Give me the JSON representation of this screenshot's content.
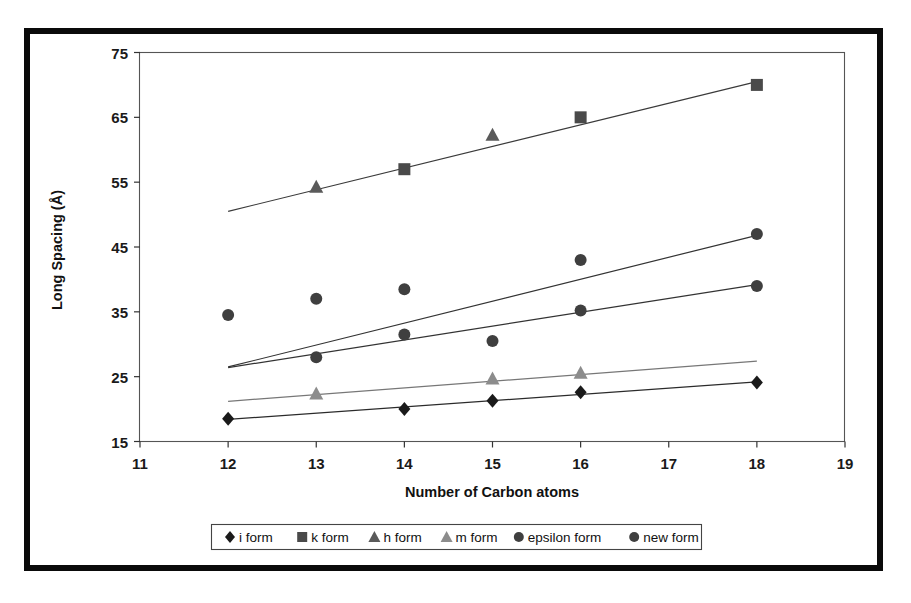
{
  "figure": {
    "frame_color": "#0a0a0a",
    "background": "#ffffff"
  },
  "chart_data": {
    "type": "scatter",
    "title": "",
    "xlabel": "Number of Carbon atoms",
    "ylabel": "Long Spacing (Å)",
    "xlim": [
      11,
      19
    ],
    "ylim": [
      15,
      75
    ],
    "xticks": [
      11,
      12,
      13,
      14,
      15,
      16,
      17,
      18,
      19
    ],
    "yticks": [
      15,
      25,
      35,
      45,
      55,
      65,
      75
    ],
    "xtick_labels": [
      "11",
      "12",
      "13",
      "14",
      "15",
      "16",
      "17",
      "18",
      "19"
    ],
    "ytick_labels": [
      "15",
      "25",
      "35",
      "45",
      "55",
      "65",
      "75"
    ],
    "grid": false,
    "legend_position": "bottom",
    "series": [
      {
        "name": "i form",
        "marker": "diamond",
        "color": "#1a1a1a",
        "line_color": "#2b2b2b",
        "x": [
          12,
          14,
          15,
          16,
          18
        ],
        "y": [
          18.5,
          20.0,
          21.3,
          22.6,
          24.1
        ],
        "trend": {
          "x": [
            12,
            18
          ],
          "y": [
            18.4,
            24.2
          ]
        }
      },
      {
        "name": "k form",
        "marker": "square",
        "color": "#4a4a4a",
        "line_color": "#3a3a3a",
        "x": [
          14,
          16,
          18
        ],
        "y": [
          57.0,
          65.0,
          70.0
        ],
        "trend": {
          "x": [
            12,
            18
          ],
          "y": [
            50.5,
            70.5
          ]
        }
      },
      {
        "name": "h form",
        "marker": "triangle",
        "color": "#5a5a5a",
        "line_color": "#3a3a3a",
        "x": [
          13,
          15
        ],
        "y": [
          54.3,
          62.3
        ],
        "trend": {
          "x": [
            12,
            18
          ],
          "y": [
            50.5,
            70.5
          ]
        }
      },
      {
        "name": "m form",
        "marker": "triangle",
        "color": "#8c8c8c",
        "line_color": "#777777",
        "x": [
          13,
          15,
          16
        ],
        "y": [
          22.4,
          24.7,
          25.6
        ],
        "trend": {
          "x": [
            12,
            18
          ],
          "y": [
            21.2,
            27.4
          ]
        }
      },
      {
        "name": "epsilon form",
        "marker": "circle",
        "color": "#3f3f3f",
        "line_color": "#333333",
        "x": [
          12,
          13,
          14,
          16,
          18
        ],
        "y": [
          34.5,
          37.0,
          38.5,
          43.0,
          47.0
        ],
        "trend": {
          "x": [
            12,
            18
          ],
          "y": [
            26.5,
            46.8
          ]
        }
      },
      {
        "name": "new form",
        "marker": "circle",
        "color": "#3f3f3f",
        "line_color": "#333333",
        "x": [
          13,
          14,
          15,
          16,
          18
        ],
        "y": [
          28.0,
          31.5,
          30.5,
          35.2,
          39.0
        ],
        "trend": {
          "x": [
            12,
            18
          ],
          "y": [
            26.4,
            39.2
          ]
        }
      }
    ]
  },
  "legend": {
    "items": [
      {
        "label": "i form",
        "marker": "diamond",
        "color": "#1a1a1a"
      },
      {
        "label": "k form",
        "marker": "square",
        "color": "#4a4a4a"
      },
      {
        "label": "h form",
        "marker": "triangle",
        "color": "#5a5a5a"
      },
      {
        "label": "m form",
        "marker": "triangle",
        "color": "#8c8c8c"
      },
      {
        "label": "epsilon form",
        "marker": "circle",
        "color": "#3f3f3f"
      },
      {
        "label": "new form",
        "marker": "circle",
        "color": "#3f3f3f"
      }
    ]
  }
}
